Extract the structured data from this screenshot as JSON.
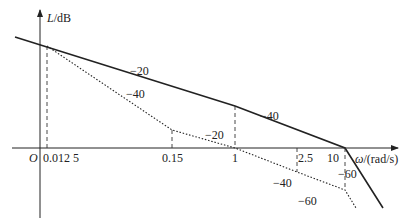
{
  "diagram": {
    "type": "bode-magnitude-asymptotic",
    "y_axis": {
      "symbol": "L",
      "unit": "/dB"
    },
    "x_axis": {
      "symbol": "ω",
      "unit": "/(rad/s)"
    },
    "origin_label": "O",
    "tick_labels": [
      "0.012 5",
      "0.15",
      "1",
      "2.5",
      "10"
    ],
    "solid_curve": {
      "slopes": [
        "−20",
        "−40",
        "−60"
      ],
      "corner_frequencies": [
        "1",
        "10"
      ]
    },
    "dotted_curve": {
      "slopes": [
        "−40",
        "−20",
        "−40",
        "−60"
      ],
      "corner_frequencies": [
        "0.012 5",
        "0.15",
        "1",
        "2.5",
        "10"
      ]
    },
    "colors": {
      "line": "#222222",
      "background": "#ffffff"
    }
  }
}
